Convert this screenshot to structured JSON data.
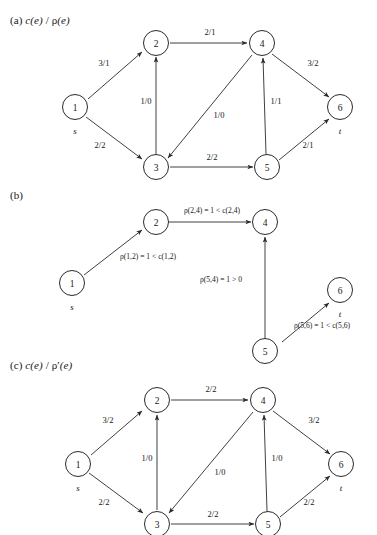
{
  "figure": {
    "panels": [
      {
        "id": "a",
        "tag": "(a)",
        "title_prefix": "(a) ",
        "title_c": "c(e)",
        "title_sep": " / ",
        "title_rho": "ρ",
        "title_e": "(e)",
        "title_full": "(a) c(e) / ρ(e)",
        "nodes": [
          {
            "id": "1",
            "label": "1",
            "sublabel": "s"
          },
          {
            "id": "2",
            "label": "2",
            "sublabel": ""
          },
          {
            "id": "3",
            "label": "3",
            "sublabel": ""
          },
          {
            "id": "4",
            "label": "4",
            "sublabel": ""
          },
          {
            "id": "5",
            "label": "5",
            "sublabel": ""
          },
          {
            "id": "6",
            "label": "6",
            "sublabel": "t"
          }
        ],
        "edges": [
          {
            "from": "1",
            "to": "2",
            "label": "3/1"
          },
          {
            "from": "1",
            "to": "3",
            "label": "2/2"
          },
          {
            "from": "3",
            "to": "2",
            "label": "1/0"
          },
          {
            "from": "2",
            "to": "4",
            "label": "2/1"
          },
          {
            "from": "4",
            "to": "3",
            "label": "1/0"
          },
          {
            "from": "5",
            "to": "4",
            "label": "1/1"
          },
          {
            "from": "4",
            "to": "6",
            "label": "3/2"
          },
          {
            "from": "3",
            "to": "5",
            "label": "2/2"
          },
          {
            "from": "5",
            "to": "6",
            "label": "2/1"
          }
        ]
      },
      {
        "id": "b",
        "tag": "(b)",
        "title_full": "(b)",
        "nodes": [
          {
            "id": "1",
            "label": "1",
            "sublabel": "s"
          },
          {
            "id": "2",
            "label": "2",
            "sublabel": ""
          },
          {
            "id": "4",
            "label": "4",
            "sublabel": ""
          },
          {
            "id": "5",
            "label": "5",
            "sublabel": ""
          },
          {
            "id": "6",
            "label": "6",
            "sublabel": "t"
          }
        ],
        "edges": [
          {
            "from": "1",
            "to": "2",
            "label": "ρ(1,2) = 1 < c(1,2)"
          },
          {
            "from": "2",
            "to": "4",
            "label": "ρ(2,4) = 1 < c(2,4)"
          },
          {
            "from": "5",
            "to": "4",
            "label": "ρ(5,4) = 1 > 0"
          },
          {
            "from": "5",
            "to": "6",
            "label": "ρ(5,6) = 1 < c(5,6)"
          }
        ]
      },
      {
        "id": "c",
        "tag": "(c)",
        "title_prefix": "(c) ",
        "title_c": "c(e)",
        "title_sep": " / ",
        "title_rho": "ρ'",
        "title_e": "(e)",
        "title_full": "(c) c(e) / ρ'(e)",
        "nodes": [
          {
            "id": "1",
            "label": "1",
            "sublabel": "s"
          },
          {
            "id": "2",
            "label": "2",
            "sublabel": ""
          },
          {
            "id": "3",
            "label": "3",
            "sublabel": ""
          },
          {
            "id": "4",
            "label": "4",
            "sublabel": ""
          },
          {
            "id": "5",
            "label": "5",
            "sublabel": ""
          },
          {
            "id": "6",
            "label": "6",
            "sublabel": "t"
          }
        ],
        "edges": [
          {
            "from": "1",
            "to": "2",
            "label": "3/2"
          },
          {
            "from": "1",
            "to": "3",
            "label": "2/2"
          },
          {
            "from": "3",
            "to": "2",
            "label": "1/0"
          },
          {
            "from": "2",
            "to": "4",
            "label": "2/2"
          },
          {
            "from": "4",
            "to": "3",
            "label": "1/0"
          },
          {
            "from": "5",
            "to": "4",
            "label": "1/0"
          },
          {
            "from": "4",
            "to": "6",
            "label": "3/2"
          },
          {
            "from": "3",
            "to": "5",
            "label": "2/2"
          },
          {
            "from": "5",
            "to": "6",
            "label": "2/2"
          }
        ]
      }
    ],
    "colors": {
      "stroke": "#2a2a2a",
      "text": "#161616",
      "background": "#ffffff"
    }
  }
}
